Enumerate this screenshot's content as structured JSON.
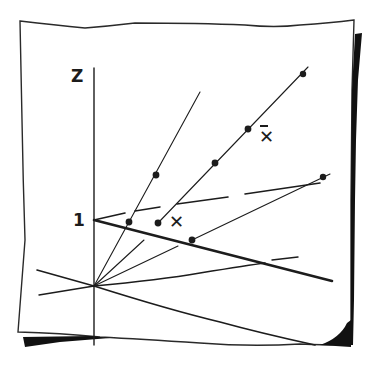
{
  "diagram": {
    "labels": {
      "z_axis": "Z",
      "unit_mark": "1",
      "x_point": "✕",
      "x_bar_point": "✕"
    },
    "colors": {
      "ink": "#1c1c1c",
      "paper": "#ffffff",
      "shadow": "#111111"
    },
    "points": {
      "origin": [
        94,
        286
      ],
      "unit_on_z": [
        94,
        220
      ]
    },
    "dots": [
      {
        "x": 156,
        "y": 175
      },
      {
        "x": 129,
        "y": 222
      },
      {
        "x": 158,
        "y": 223
      },
      {
        "x": 215,
        "y": 163
      },
      {
        "x": 248,
        "y": 129
      },
      {
        "x": 303,
        "y": 74
      },
      {
        "x": 192,
        "y": 240
      },
      {
        "x": 323,
        "y": 177
      }
    ]
  }
}
